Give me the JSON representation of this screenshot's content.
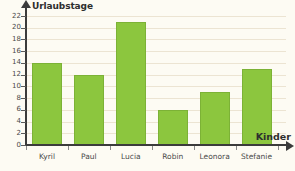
{
  "chart_data": {
    "type": "bar",
    "title": "",
    "xlabel": "Kinder",
    "ylabel": "Urlaubstage",
    "categories": [
      "Kyril",
      "Paul",
      "Lucia",
      "Robin",
      "Leonora",
      "Stefanie"
    ],
    "values": [
      14,
      12,
      21,
      6,
      9,
      13
    ],
    "ylim": [
      0,
      22
    ],
    "ytick_step": 2,
    "yticks": [
      0,
      2,
      4,
      6,
      8,
      10,
      12,
      14,
      16,
      18,
      20,
      22
    ],
    "ytick_labels": [
      "0",
      "2",
      "4",
      "6",
      "8",
      "10",
      "12",
      "14",
      "16",
      "18",
      "20",
      "22"
    ],
    "grid": true,
    "legend": false,
    "bar_color": "#8cc63e",
    "grid_color": "#ece4d2",
    "axis_color": "#3b3b3b",
    "background_color": "#fdfbf3"
  }
}
